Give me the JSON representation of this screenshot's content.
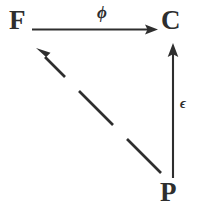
{
  "diagram": {
    "type": "commutative-diagram",
    "background_color": "#ffffff",
    "ink_color": "#2e2e2e",
    "nodes": [
      {
        "id": "F",
        "label": "F",
        "position": "top-left",
        "x": 19,
        "y": 21
      },
      {
        "id": "C",
        "label": "C",
        "position": "top-right",
        "x": 175,
        "y": 21
      },
      {
        "id": "P",
        "label": "P",
        "position": "bottom-right",
        "x": 174,
        "y": 193
      }
    ],
    "edges": [
      {
        "id": "phi",
        "from": "F",
        "to": "C",
        "label": "ϕ",
        "style": "solid",
        "orientation": "horizontal",
        "direction": "left-to-right",
        "arrowhead": "filled-triangle"
      },
      {
        "id": "epsilon",
        "from": "P",
        "to": "C",
        "label": "ϵ",
        "style": "solid",
        "orientation": "vertical",
        "direction": "bottom-to-top",
        "arrowhead": "filled-triangle"
      },
      {
        "id": "dashed-diagonal",
        "from": "P",
        "to": "F",
        "label": "",
        "style": "dashed",
        "orientation": "diagonal",
        "direction": "bottom-right-to-top-left",
        "arrowhead": "filled-triangle",
        "dash_segments": 3
      }
    ],
    "labels": {
      "phi": "ϕ",
      "epsilon": "ϵ"
    }
  }
}
